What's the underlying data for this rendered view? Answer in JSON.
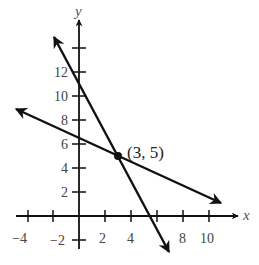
{
  "figure": {
    "type": "coordinate-plane",
    "x_axis_label": "x",
    "y_axis_label": "y",
    "x_tick_labels": [
      "−4",
      "−2",
      "2",
      "4",
      "8",
      "10"
    ],
    "y_tick_labels": [
      "−2",
      "2",
      "4",
      "6",
      "8",
      "10",
      "12"
    ],
    "intersection_label": "(3, 5)",
    "intersection_point": [
      3,
      5
    ],
    "lines": [
      {
        "name": "steep-line",
        "slope": -2,
        "intercept": 11,
        "equation": "y = -2x + 11"
      },
      {
        "name": "shallow-line",
        "slope": -0.5,
        "intercept": 6.5,
        "equation": "y = -0.5x + 6.5"
      }
    ],
    "x_range": [
      -4.8,
      12
    ],
    "y_range": [
      -2.7,
      16
    ],
    "colors": {
      "ink": "#111111",
      "labels": "#444444"
    }
  }
}
